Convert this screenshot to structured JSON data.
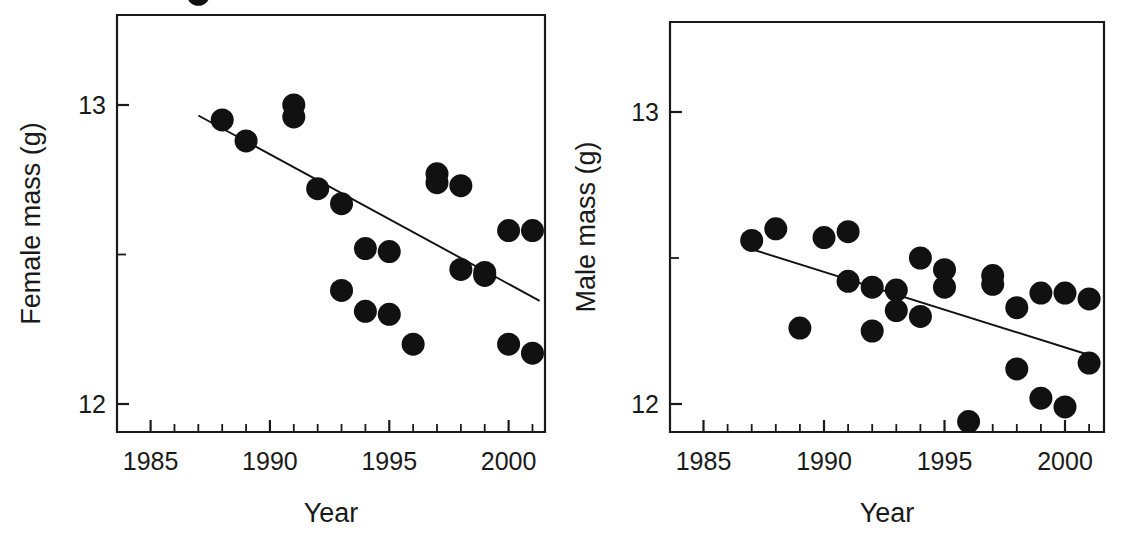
{
  "figure": {
    "panel_count": 2,
    "background_color": "#ffffff",
    "ink_color": "#111111"
  },
  "chart_data": [
    {
      "type": "scatter",
      "panel": "left",
      "title": "",
      "xlabel": "Year",
      "ylabel": "Female mass (g)",
      "xlim": [
        1983.6,
        2001.8
      ],
      "ylim": [
        11.82,
        13.42
      ],
      "xticks": [
        1985,
        1990,
        1995,
        2000
      ],
      "xtick_labels": [
        "1985",
        "1990",
        "1995",
        "2000"
      ],
      "xminor_ticks": [
        1986,
        1987,
        1988,
        1989,
        1991,
        1992,
        1993,
        1994,
        1996,
        1997,
        1998,
        1999,
        2001
      ],
      "yticks": [
        12,
        13
      ],
      "ytick_labels": [
        "12",
        "13"
      ],
      "yminor_ticks": [
        12.5
      ],
      "grid": false,
      "legend": "none",
      "x": [
        1987,
        1988,
        1989,
        1991,
        1991,
        1992,
        1993,
        1993,
        1994,
        1994,
        1995,
        1995,
        1996,
        1997,
        1997,
        1998,
        1998,
        1999,
        1999,
        2000,
        2000,
        2001,
        2001
      ],
      "y": [
        13.37,
        12.95,
        12.88,
        13.0,
        12.96,
        12.72,
        12.67,
        12.38,
        12.52,
        12.31,
        12.51,
        12.3,
        12.2,
        12.77,
        12.74,
        12.73,
        12.45,
        12.43,
        12.44,
        12.58,
        12.2,
        12.58,
        12.17
      ],
      "trend_line": {
        "x": [
          1987.0,
          2001.3
        ],
        "y": [
          12.965,
          12.345
        ],
        "description": "negative linear regression fit"
      }
    },
    {
      "type": "scatter",
      "panel": "right",
      "title": "",
      "xlabel": "Year",
      "ylabel": "Male mass (g)",
      "xlim": [
        1983.6,
        2001.8
      ],
      "ylim": [
        11.82,
        13.42
      ],
      "xticks": [
        1985,
        1990,
        1995,
        2000
      ],
      "xtick_labels": [
        "1985",
        "1990",
        "1995",
        "2000"
      ],
      "xminor_ticks": [
        1986,
        1987,
        1988,
        1989,
        1991,
        1992,
        1993,
        1994,
        1996,
        1997,
        1998,
        1999,
        2001
      ],
      "yticks": [
        12,
        13
      ],
      "ytick_labels": [
        "12",
        "13"
      ],
      "yminor_ticks": [
        12.5
      ],
      "grid": false,
      "legend": "none",
      "x": [
        1987,
        1988,
        1989,
        1990,
        1991,
        1991,
        1992,
        1992,
        1993,
        1993,
        1994,
        1994,
        1995,
        1995,
        1996,
        1997,
        1997,
        1998,
        1998,
        1999,
        1999,
        2000,
        2000,
        2001,
        2001
      ],
      "y": [
        12.56,
        12.6,
        12.26,
        12.57,
        12.59,
        12.42,
        12.4,
        12.25,
        12.39,
        12.32,
        12.5,
        12.3,
        12.46,
        12.4,
        11.94,
        12.44,
        12.41,
        12.33,
        12.12,
        12.38,
        12.02,
        12.38,
        11.99,
        12.36,
        12.14
      ],
      "trend_line": {
        "x": [
          1987.0,
          2001.3
        ],
        "y": [
          12.53,
          12.16
        ],
        "description": "negative linear regression fit"
      }
    }
  ]
}
